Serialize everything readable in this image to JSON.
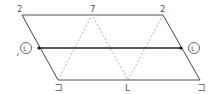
{
  "diagram": {
    "type": "parallelogram-with-zigzag",
    "labels": {
      "top_left": "2",
      "top_middle": "7",
      "top_right": "2",
      "bottom_left": "コ",
      "bottom_middle": "L",
      "bottom_right": "コ",
      "left_circle": "L",
      "right_circle": "L"
    },
    "colors": {
      "line": "#444444",
      "dashed": "#888888",
      "label": "#555555"
    }
  }
}
